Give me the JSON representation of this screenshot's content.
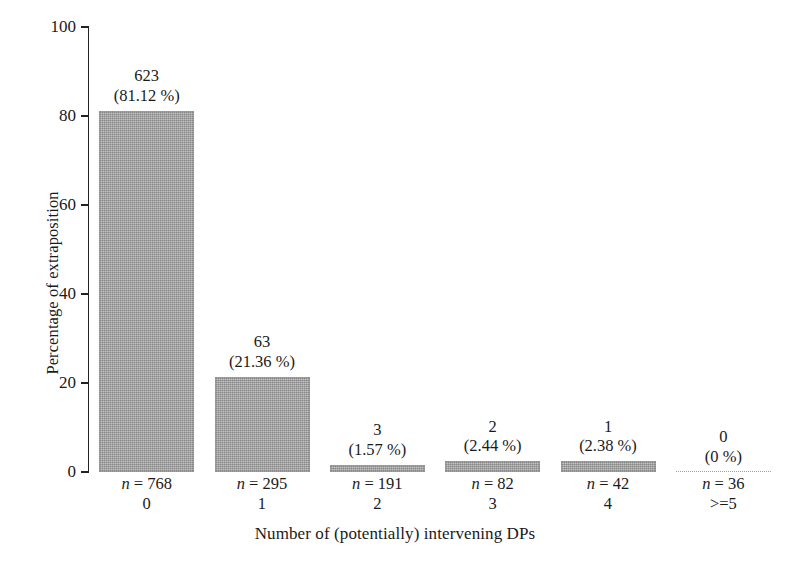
{
  "chart_data": {
    "type": "bar",
    "title": "",
    "xlabel": "Number of (potentially) intervening DPs",
    "ylabel": "Percentage of extraposition",
    "ylim": [
      0,
      100
    ],
    "yticks": [
      0,
      20,
      40,
      60,
      80,
      100
    ],
    "ytick_labels": [
      "0",
      "20",
      "40",
      "60",
      "80",
      "100"
    ],
    "grid": false,
    "legend": null,
    "categories": [
      "0",
      "1",
      "2",
      "3",
      "4",
      ">=5"
    ],
    "values": [
      81.12,
      21.36,
      1.57,
      2.44,
      2.38,
      0
    ],
    "bar_color": "#9a9a9a",
    "bars": [
      {
        "category": "0",
        "count": "623",
        "percent_label": "(81.12 %)",
        "percent_value": 81.12,
        "sample_size_label": "n = 768",
        "sample_size": 768
      },
      {
        "category": "1",
        "count": "63",
        "percent_label": "(21.36 %)",
        "percent_value": 21.36,
        "sample_size_label": "n = 295",
        "sample_size": 295
      },
      {
        "category": "2",
        "count": "3",
        "percent_label": "(1.57 %)",
        "percent_value": 1.57,
        "sample_size_label": "n = 191",
        "sample_size": 191
      },
      {
        "category": "3",
        "count": "2",
        "percent_label": "(2.44 %)",
        "percent_value": 2.44,
        "sample_size_label": "n = 82",
        "sample_size": 82
      },
      {
        "category": "4",
        "count": "1",
        "percent_label": "(2.38 %)",
        "percent_value": 2.38,
        "sample_size_label": "n = 42",
        "sample_size": 42
      },
      {
        "category": ">=5",
        "count": "0",
        "percent_label": "(0 %)",
        "percent_value": 0,
        "sample_size_label": "n = 36",
        "sample_size": 36
      }
    ]
  }
}
